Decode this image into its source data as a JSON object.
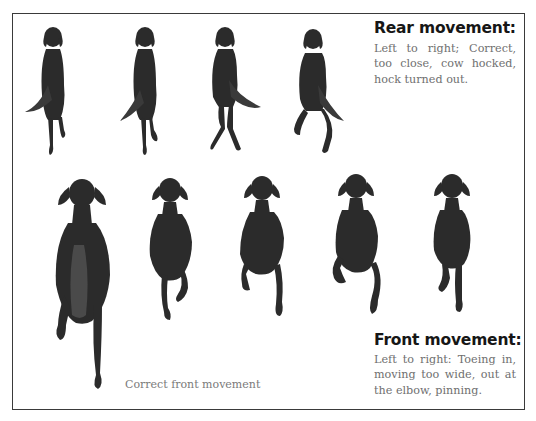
{
  "figure": {
    "rear": {
      "title": "Rear movement:",
      "description": "Left to right; Correct, too close, cow hocked, hock turned out.",
      "dogs": [
        {
          "label": "correct",
          "view": "rear"
        },
        {
          "label": "too close",
          "view": "rear"
        },
        {
          "label": "cow hocked",
          "view": "rear"
        },
        {
          "label": "hock turned out",
          "view": "rear"
        }
      ]
    },
    "front": {
      "title": "Front movement:",
      "description": "Left to right: Toeing in, moving too wide, out at the elbow, pinning.",
      "correct_label": "Correct front movement",
      "dogs": [
        {
          "label": "correct",
          "view": "front"
        },
        {
          "label": "toeing in",
          "view": "front"
        },
        {
          "label": "moving too wide",
          "view": "front"
        },
        {
          "label": "out at the elbow",
          "view": "front"
        },
        {
          "label": "pinning",
          "view": "front"
        }
      ]
    },
    "colors": {
      "dog_fill": "#2b2b2b",
      "border": "#3a3a3a",
      "title_text": "#161616",
      "body_text": "#6f6f6f"
    }
  }
}
